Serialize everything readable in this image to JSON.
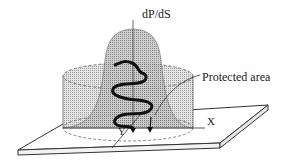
{
  "figure": {
    "axis_labels": {
      "vertical": "dP/dS",
      "x": "X",
      "y": "Y"
    },
    "annotations": {
      "protected_area": "Protected area"
    },
    "elements": [
      "base-plate",
      "cylinder-protected-area",
      "bell-curve-probability-density",
      "wavy-path-with-arrows"
    ],
    "colors": {
      "stroke": "#222222",
      "fill_stipple_light": "#d8d8d8",
      "fill_stipple_dark": "#b5b5b5",
      "background": "#ffffff"
    }
  }
}
